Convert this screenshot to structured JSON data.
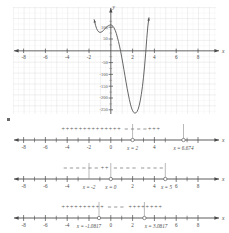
{
  "figure": {
    "axis_labels": {
      "x": "x",
      "y": "y"
    }
  },
  "chart_data": [
    {
      "id": "cartesian-plot",
      "type": "line",
      "title": "",
      "xlabel": "x",
      "ylabel": "y",
      "xlim": [
        -9.2,
        9.4
      ],
      "ylim": [
        -280,
        140
      ],
      "grid": true,
      "xticks": [
        -8,
        -6,
        -4,
        -2,
        2,
        4,
        6,
        8
      ],
      "xtick_labels": [
        "-8",
        "-6",
        "-4",
        "-2",
        "2",
        "4",
        "6",
        "8"
      ],
      "yticks": [
        100,
        50,
        -50,
        -100,
        -150,
        -200,
        -250
      ],
      "ytick_labels": [
        "100",
        "50",
        "-50",
        "-100",
        "-150",
        "-200",
        "-250"
      ],
      "series": [
        {
          "name": "f(x)",
          "x": [
            -3.05,
            -2.8,
            -2.6,
            -2.4,
            -2.2,
            -2.0,
            -1.8,
            -1.6,
            -1.4,
            -1.2,
            -1.0,
            -0.8,
            -0.6,
            -0.4,
            -0.2,
            0.0,
            0.2,
            0.4,
            0.6,
            0.8,
            1.0,
            1.2,
            1.4,
            1.6,
            1.8,
            2.0,
            2.2,
            2.4,
            2.6,
            2.8,
            3.0,
            3.2,
            3.4,
            3.6,
            3.8,
            4.0,
            4.2,
            4.4,
            4.6,
            4.8,
            5.0,
            5.2,
            5.4,
            5.6,
            5.8,
            6.0,
            6.2,
            6.4,
            6.6,
            6.8,
            7.0
          ],
          "y": [
            132,
            108,
            94,
            85,
            80,
            78,
            79,
            81,
            85,
            90,
            95,
            100,
            104,
            107,
            109,
            110,
            108,
            104,
            97,
            87,
            74,
            58,
            40,
            20,
            -2,
            -26,
            -52,
            -79,
            -106,
            -133,
            -159,
            -183,
            -206,
            -226,
            -242,
            -254,
            -261,
            -264,
            -263,
            -258,
            -248,
            -233,
            -212,
            -185,
            -152,
            -112,
            -65,
            -10,
            52,
            105,
            140
          ]
        }
      ],
      "annotations": []
    },
    {
      "id": "sign-line-1",
      "type": "sign-chart",
      "axis_label": "x",
      "xlim": [
        -9.2,
        9.4
      ],
      "ticks": [
        -8,
        -6,
        -4,
        -2,
        0,
        2,
        4,
        6,
        8
      ],
      "tick_labels": [
        "-8",
        "-6",
        "-4",
        "-2",
        "0",
        "2",
        "4",
        "6",
        "8"
      ],
      "critical_points": [
        {
          "value": 2,
          "label": "x = 2",
          "marker": "open"
        },
        {
          "value": 6.674,
          "label": "x = 6.674",
          "marker": "open"
        }
      ],
      "intervals": [
        {
          "from": -9.2,
          "to": 2,
          "sign": "+"
        },
        {
          "from": 2,
          "to": 6.674,
          "sign": "-"
        },
        {
          "from": 6.674,
          "to": 9.4,
          "sign": "+"
        }
      ]
    },
    {
      "id": "sign-line-2",
      "type": "sign-chart",
      "axis_label": "x",
      "xlim": [
        -9.2,
        9.4
      ],
      "ticks": [
        -8,
        -6,
        -4,
        -2,
        0,
        2,
        4,
        6,
        8
      ],
      "tick_labels": [
        "-8",
        "-6",
        "-4",
        "-2",
        "2",
        "6",
        "8"
      ],
      "critical_points": [
        {
          "value": -2,
          "label": "x = -2",
          "marker": "bar"
        },
        {
          "value": 0,
          "label": "x = 0",
          "marker": "open"
        },
        {
          "value": 5,
          "label": "x = 5",
          "marker": "open"
        }
      ],
      "intervals": [
        {
          "from": -9.2,
          "to": -2,
          "sign": "-"
        },
        {
          "from": -2,
          "to": 0,
          "sign": "+"
        },
        {
          "from": 0,
          "to": 5,
          "sign": "-"
        },
        {
          "from": 5,
          "to": 9.4,
          "sign": "-"
        }
      ]
    },
    {
      "id": "sign-line-3",
      "type": "sign-chart",
      "axis_label": "x",
      "xlim": [
        -9.2,
        9.4
      ],
      "ticks": [
        -8,
        -6,
        -4,
        -2,
        0,
        2,
        4,
        6,
        8
      ],
      "tick_labels": [
        "-8",
        "-6",
        "-4",
        "0",
        "2",
        "6",
        "8"
      ],
      "critical_points": [
        {
          "value": -1.0817,
          "label": "x = -1.0817",
          "marker": "open"
        },
        {
          "value": 3.0817,
          "label": "x = 3.0817",
          "marker": "open"
        }
      ],
      "intervals": [
        {
          "from": -9.2,
          "to": -1.0817,
          "sign": "+"
        },
        {
          "from": -1.0817,
          "to": 3.0817,
          "sign": "-"
        },
        {
          "from": 3.0817,
          "to": 9.4,
          "sign": "+"
        }
      ]
    }
  ],
  "labels": {
    "graph_x": "x",
    "graph_y": "y",
    "nl_axis": "x",
    "x_ticks": [
      "-8",
      "-6",
      "-4",
      "-2",
      "2",
      "4",
      "6",
      "8"
    ],
    "y_ticks": [
      "100",
      "50",
      "-50",
      "-100",
      "-150",
      "-200",
      "-250"
    ],
    "nl1_ticks": [
      "-8",
      "-6",
      "-4",
      "-2",
      "0",
      "4"
    ],
    "nl1_crit_a": "x = 2",
    "nl1_crit_b": "x = 6.674",
    "nl2_ticks": [
      "-8",
      "-6",
      "-4",
      "2",
      "4",
      "6",
      "8"
    ],
    "nl2_crit_a": "x = -2",
    "nl2_crit_b": "x = 0",
    "nl2_crit_c": "x = 5",
    "nl3_ticks": [
      "-8",
      "-6",
      "-4",
      "0",
      "2",
      "6",
      "8"
    ],
    "nl3_crit_a": "x = -1.0817",
    "nl3_crit_b": "x = 3.0817",
    "plus": "+",
    "minus": "-"
  }
}
